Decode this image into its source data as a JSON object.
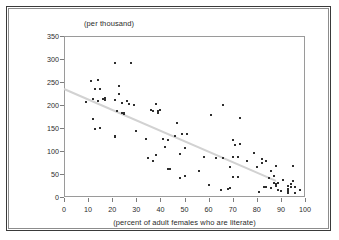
{
  "chart_data": {
    "type": "scatter",
    "title": "",
    "subtitle": "",
    "ylabel": "(per thousand)",
    "xlabel": "(percent of adult females who are literate)",
    "xlim": [
      0,
      100
    ],
    "ylim": [
      0,
      350
    ],
    "xticks": [
      0,
      10,
      20,
      30,
      40,
      50,
      60,
      70,
      80,
      90,
      100
    ],
    "yticks": [
      0,
      50,
      100,
      150,
      200,
      250,
      300,
      350
    ],
    "grid": false,
    "legend": "none",
    "marker_color": "#2e2e2e",
    "trendline": {
      "present": true,
      "color": "#d2d2d2",
      "x_start": 0,
      "y_start": 237,
      "x_end": 88,
      "y_end": 37
    },
    "points": [
      [
        9,
        206
      ],
      [
        11,
        253
      ],
      [
        12,
        170
      ],
      [
        12,
        212
      ],
      [
        13,
        148
      ],
      [
        13,
        235
      ],
      [
        14,
        255
      ],
      [
        14,
        209
      ],
      [
        15,
        234
      ],
      [
        15,
        149
      ],
      [
        16,
        213
      ],
      [
        17,
        211
      ],
      [
        17,
        216
      ],
      [
        21,
        292
      ],
      [
        21,
        211
      ],
      [
        21,
        133
      ],
      [
        21,
        131
      ],
      [
        22,
        188
      ],
      [
        22,
        186
      ],
      [
        23,
        242
      ],
      [
        23,
        225
      ],
      [
        24,
        205
      ],
      [
        24,
        182
      ],
      [
        25,
        181
      ],
      [
        25,
        183
      ],
      [
        26,
        209
      ],
      [
        27,
        203
      ],
      [
        28,
        292
      ],
      [
        29,
        200
      ],
      [
        30,
        144
      ],
      [
        34,
        126
      ],
      [
        35,
        85
      ],
      [
        36,
        190
      ],
      [
        37,
        188
      ],
      [
        37,
        79
      ],
      [
        38,
        203
      ],
      [
        38,
        92
      ],
      [
        39,
        186
      ],
      [
        39,
        182
      ],
      [
        40,
        190
      ],
      [
        41,
        126
      ],
      [
        42,
        109
      ],
      [
        43,
        124
      ],
      [
        43,
        61
      ],
      [
        44,
        60
      ],
      [
        46,
        132
      ],
      [
        47,
        161
      ],
      [
        48,
        41
      ],
      [
        48,
        93
      ],
      [
        49,
        137
      ],
      [
        50,
        45
      ],
      [
        50,
        107
      ],
      [
        51,
        136
      ],
      [
        56,
        57
      ],
      [
        58,
        87
      ],
      [
        60,
        26
      ],
      [
        61,
        179
      ],
      [
        63,
        84
      ],
      [
        65,
        16
      ],
      [
        66,
        199
      ],
      [
        66,
        84
      ],
      [
        68,
        18
      ],
      [
        69,
        19
      ],
      [
        69,
        66
      ],
      [
        70,
        44
      ],
      [
        70,
        125
      ],
      [
        70,
        88
      ],
      [
        71,
        113
      ],
      [
        72,
        87
      ],
      [
        72,
        43
      ],
      [
        73,
        172
      ],
      [
        73,
        116
      ],
      [
        76,
        78
      ],
      [
        79,
        96
      ],
      [
        80,
        65
      ],
      [
        81,
        11
      ],
      [
        82,
        74
      ],
      [
        82,
        82
      ],
      [
        83,
        21
      ],
      [
        84,
        79
      ],
      [
        84,
        22
      ],
      [
        85,
        41
      ],
      [
        86,
        20
      ],
      [
        86,
        57
      ],
      [
        87,
        30
      ],
      [
        87,
        45
      ],
      [
        88,
        29
      ],
      [
        88,
        23
      ],
      [
        88,
        67
      ],
      [
        89,
        31
      ],
      [
        89,
        16
      ],
      [
        90,
        14
      ],
      [
        91,
        37
      ],
      [
        93,
        23
      ],
      [
        93,
        13
      ],
      [
        93,
        9
      ],
      [
        93,
        18
      ],
      [
        94,
        28
      ],
      [
        94,
        22
      ],
      [
        95,
        67
      ],
      [
        95,
        35
      ],
      [
        96,
        9
      ],
      [
        96,
        21
      ],
      [
        98,
        16
      ]
    ]
  }
}
